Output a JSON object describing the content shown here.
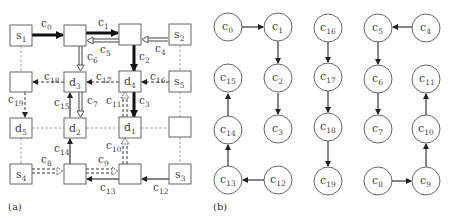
{
  "panel_a": {
    "caption": "(a)",
    "nodes": {
      "s1": {
        "base": "s",
        "sub": "1"
      },
      "s2": {
        "base": "s",
        "sub": "2"
      },
      "s3": {
        "base": "s",
        "sub": "3"
      },
      "s4": {
        "base": "s",
        "sub": "4"
      },
      "s5": {
        "base": "s",
        "sub": "5"
      },
      "d1": {
        "base": "d",
        "sub": "1"
      },
      "d2": {
        "base": "d",
        "sub": "2"
      },
      "d3": {
        "base": "d",
        "sub": "3"
      },
      "d4": {
        "base": "d",
        "sub": "4"
      },
      "d5": {
        "base": "d",
        "sub": "5"
      }
    },
    "edges": {
      "c0": {
        "base": "c",
        "sub": "0"
      },
      "c1": {
        "base": "c",
        "sub": "1"
      },
      "c2": {
        "base": "c",
        "sub": "2"
      },
      "c3": {
        "base": "c",
        "sub": "3"
      },
      "c4": {
        "base": "c",
        "sub": "4"
      },
      "c5": {
        "base": "c",
        "sub": "5"
      },
      "c6": {
        "base": "c",
        "sub": "6"
      },
      "c7": {
        "base": "c",
        "sub": "7"
      },
      "c8": {
        "base": "c",
        "sub": "8"
      },
      "c9": {
        "base": "c",
        "sub": "9"
      },
      "c10": {
        "base": "c",
        "sub": "10"
      },
      "c11": {
        "base": "c",
        "sub": "11"
      },
      "c12": {
        "base": "c",
        "sub": "12"
      },
      "c13": {
        "base": "c",
        "sub": "13"
      },
      "c14": {
        "base": "c",
        "sub": "14"
      },
      "c15": {
        "base": "c",
        "sub": "15"
      },
      "c16": {
        "base": "c",
        "sub": "16"
      },
      "c17": {
        "base": "c",
        "sub": "17"
      },
      "c18": {
        "base": "c",
        "sub": "18"
      },
      "c19": {
        "base": "c",
        "sub": "19"
      }
    }
  },
  "panel_b": {
    "caption": "(b)",
    "nodes": {
      "c0": {
        "base": "c",
        "sub": "0"
      },
      "c1": {
        "base": "c",
        "sub": "1"
      },
      "c2": {
        "base": "c",
        "sub": "2"
      },
      "c3": {
        "base": "c",
        "sub": "3"
      },
      "c4": {
        "base": "c",
        "sub": "4"
      },
      "c5": {
        "base": "c",
        "sub": "5"
      },
      "c6": {
        "base": "c",
        "sub": "6"
      },
      "c7": {
        "base": "c",
        "sub": "7"
      },
      "c8": {
        "base": "c",
        "sub": "8"
      },
      "c9": {
        "base": "c",
        "sub": "9"
      },
      "c10": {
        "base": "c",
        "sub": "10"
      },
      "c11": {
        "base": "c",
        "sub": "11"
      },
      "c12": {
        "base": "c",
        "sub": "12"
      },
      "c13": {
        "base": "c",
        "sub": "13"
      },
      "c14": {
        "base": "c",
        "sub": "14"
      },
      "c15": {
        "base": "c",
        "sub": "15"
      },
      "c16": {
        "base": "c",
        "sub": "16"
      },
      "c17": {
        "base": "c",
        "sub": "17"
      },
      "c18": {
        "base": "c",
        "sub": "18"
      },
      "c19": {
        "base": "c",
        "sub": "19"
      }
    },
    "edges": [
      [
        "c0",
        "c1"
      ],
      [
        "c1",
        "c2"
      ],
      [
        "c2",
        "c3"
      ],
      [
        "c16",
        "c17"
      ],
      [
        "c17",
        "c18"
      ],
      [
        "c18",
        "c19"
      ],
      [
        "c4",
        "c5"
      ],
      [
        "c5",
        "c6"
      ],
      [
        "c6",
        "c7"
      ],
      [
        "c8",
        "c9"
      ],
      [
        "c9",
        "c10"
      ],
      [
        "c10",
        "c11"
      ],
      [
        "c12",
        "c13"
      ],
      [
        "c13",
        "c14"
      ],
      [
        "c14",
        "c15"
      ]
    ]
  }
}
